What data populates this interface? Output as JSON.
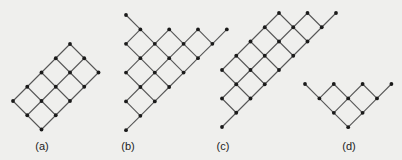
{
  "figure": {
    "background": "#efefed",
    "edge_color": "#555555",
    "node_color": "#1a1a1a",
    "node_radius": 1.9,
    "edge_width": 1.1
  },
  "diagrams": [
    {
      "id": "a",
      "label": "(a)",
      "label_pos": [
        42,
        147
      ],
      "origin": [
        13,
        44
      ],
      "step": 14.25,
      "nodes": [
        [
          4,
          0
        ],
        [
          3,
          1
        ],
        [
          5,
          1
        ],
        [
          2,
          2
        ],
        [
          4,
          2
        ],
        [
          6,
          2
        ],
        [
          1,
          3
        ],
        [
          3,
          3
        ],
        [
          5,
          3
        ],
        [
          0,
          4
        ],
        [
          2,
          4
        ],
        [
          4,
          4
        ],
        [
          1,
          5
        ],
        [
          3,
          5
        ],
        [
          2,
          6
        ]
      ]
    },
    {
      "id": "b",
      "label": "(b)",
      "label_pos": [
        128,
        147
      ],
      "origin": [
        126,
        15
      ],
      "step": 14.4,
      "nodes": [
        [
          0,
          0
        ],
        [
          1,
          1
        ],
        [
          3,
          1
        ],
        [
          5,
          1
        ],
        [
          7,
          1
        ],
        [
          0,
          2
        ],
        [
          2,
          2
        ],
        [
          4,
          2
        ],
        [
          6,
          2
        ],
        [
          1,
          3
        ],
        [
          3,
          3
        ],
        [
          5,
          3
        ],
        [
          0,
          4
        ],
        [
          2,
          4
        ],
        [
          4,
          4
        ],
        [
          1,
          5
        ],
        [
          3,
          5
        ],
        [
          0,
          6
        ],
        [
          2,
          6
        ],
        [
          1,
          7
        ],
        [
          0,
          8
        ]
      ]
    },
    {
      "id": "c",
      "label": "(c)",
      "label_pos": [
        223,
        147
      ],
      "origin": [
        222,
        13
      ],
      "step": 14.25,
      "nodes": [
        [
          4,
          0
        ],
        [
          6,
          0
        ],
        [
          8,
          0
        ],
        [
          3,
          1
        ],
        [
          5,
          1
        ],
        [
          7,
          1
        ],
        [
          2,
          2
        ],
        [
          4,
          2
        ],
        [
          6,
          2
        ],
        [
          1,
          3
        ],
        [
          3,
          3
        ],
        [
          5,
          3
        ],
        [
          0,
          4
        ],
        [
          2,
          4
        ],
        [
          4,
          4
        ],
        [
          1,
          5
        ],
        [
          3,
          5
        ],
        [
          0,
          6
        ],
        [
          2,
          6
        ],
        [
          1,
          7
        ],
        [
          0,
          8
        ]
      ]
    },
    {
      "id": "d",
      "label": "(d)",
      "label_pos": [
        349,
        147
      ],
      "origin": [
        305,
        84
      ],
      "step": 14.4,
      "nodes": [
        [
          0,
          0
        ],
        [
          2,
          0
        ],
        [
          4,
          0
        ],
        [
          6,
          0
        ],
        [
          1,
          1
        ],
        [
          3,
          1
        ],
        [
          5,
          1
        ],
        [
          2,
          2
        ],
        [
          4,
          2
        ],
        [
          3,
          3
        ]
      ]
    }
  ]
}
